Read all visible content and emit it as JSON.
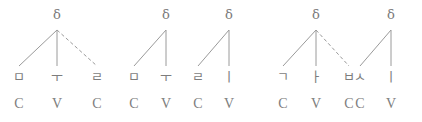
{
  "figure": {
    "kind": "syllable-structure-tree-diagram",
    "stroke_color": "#9a9a9a",
    "text_color": "#7d7d7d",
    "node_symbol": "δ",
    "groups": [
      {
        "id": "group-1",
        "gloss": "mul",
        "trees": [
          {
            "id": "tree-1",
            "root_label": "δ",
            "root_x": 57,
            "root_y": 16,
            "branches": [
              {
                "to_x": 19,
                "style": "solid"
              },
              {
                "to_x": 57,
                "style": "solid"
              },
              {
                "to_x": 97,
                "style": "dashed"
              }
            ]
          }
        ],
        "segments": [
          {
            "glyph": "ㅁ",
            "tier": "C",
            "x": 19
          },
          {
            "glyph": "ㅜ",
            "tier": "V",
            "x": 57
          },
          {
            "glyph": "ㄹ",
            "tier": "C",
            "x": 97
          }
        ]
      },
      {
        "id": "group-2",
        "gloss": "muli",
        "trees": [
          {
            "id": "tree-2",
            "root_label": "δ",
            "root_y": 16,
            "root_x": 166,
            "branches": [
              {
                "to_x": 134,
                "style": "solid"
              },
              {
                "to_x": 166,
                "style": "solid"
              }
            ]
          },
          {
            "id": "tree-3",
            "root_label": "δ",
            "root_y": 16,
            "root_x": 229,
            "branches": [
              {
                "to_x": 198,
                "style": "solid"
              },
              {
                "to_x": 229,
                "style": "solid"
              }
            ]
          }
        ],
        "segments": [
          {
            "glyph": "ㅁ",
            "tier": "C",
            "x": 134
          },
          {
            "glyph": "ㅜ",
            "tier": "V",
            "x": 166
          },
          {
            "glyph": "ㄹ",
            "tier": "C",
            "x": 198
          },
          {
            "glyph": "ㅣ",
            "tier": "V",
            "x": 229
          }
        ]
      },
      {
        "id": "group-3",
        "gloss": "gabsi",
        "trees": [
          {
            "id": "tree-4",
            "root_label": "δ",
            "root_y": 16,
            "root_x": 316,
            "branches": [
              {
                "to_x": 283,
                "style": "solid"
              },
              {
                "to_x": 316,
                "style": "solid"
              },
              {
                "to_x": 349,
                "style": "dashed"
              }
            ]
          },
          {
            "id": "tree-5",
            "root_label": "δ",
            "root_y": 16,
            "root_x": 391,
            "branches": [
              {
                "to_x": 360,
                "style": "solid"
              },
              {
                "to_x": 391,
                "style": "solid"
              }
            ]
          }
        ],
        "segments": [
          {
            "glyph": "ㄱ",
            "tier": "C",
            "x": 283
          },
          {
            "glyph": "ㅏ",
            "tier": "V",
            "x": 316
          },
          {
            "glyph": "ㅂ",
            "tier": "C",
            "x": 349
          },
          {
            "glyph": "ㅅ",
            "tier": "C",
            "x": 360
          },
          {
            "glyph": "ㅣ",
            "tier": "V",
            "x": 391
          }
        ]
      }
    ],
    "layout": {
      "root_text_y": 8,
      "branch_top_y": 30,
      "branch_bottom_y": 66,
      "segment_row_y": 70,
      "tier_row_y": 96
    }
  }
}
